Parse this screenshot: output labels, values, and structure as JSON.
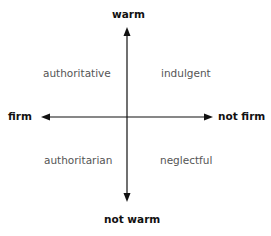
{
  "axes": {
    "top": "warm",
    "bottom": "not warm",
    "left": "firm",
    "right": "not firm"
  },
  "quadrants": {
    "top_left": "authoritative",
    "top_right": "indulgent",
    "bottom_left": "authoritarian",
    "bottom_right": "neglectful"
  },
  "colors": {
    "axis": "#111111",
    "quadrant_text": "#555555"
  }
}
